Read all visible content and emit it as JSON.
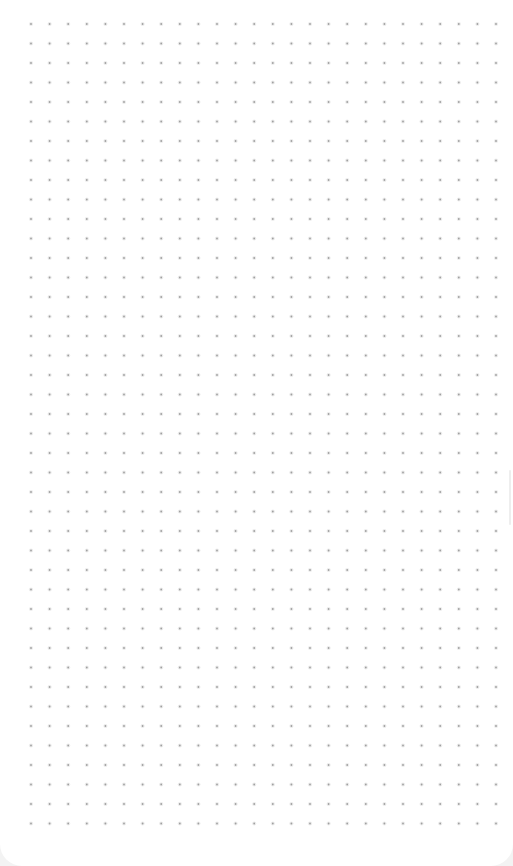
{
  "canvas": {
    "type": "dot-grid",
    "background_color": "#ffffff",
    "dot_color": "#a0a0a0",
    "dot_radius": 0.9,
    "grid": {
      "x_start": 31,
      "y_start": 24,
      "x_spacing": 18.6,
      "y_spacing": 19.5,
      "columns": 26,
      "rows": 42
    }
  }
}
